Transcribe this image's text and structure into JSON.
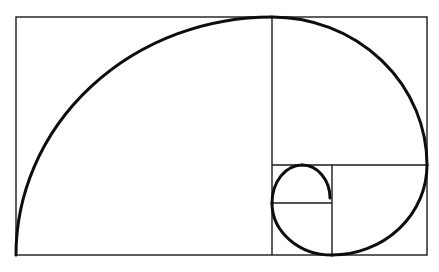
{
  "diagram": {
    "type": "golden-rectangle-spiral",
    "colors": {
      "background": "#ffffff",
      "line": "#1a1a1a",
      "spiral": "#0d0d0d"
    },
    "outer_rectangle": {
      "x": 16,
      "y": 17,
      "width": 411,
      "height": 238
    },
    "divider_lines": [
      {
        "name": "vertical-main",
        "x1": 272,
        "y1": 17,
        "x2": 272,
        "y2": 255
      },
      {
        "name": "horizontal-right",
        "x1": 272,
        "y1": 165,
        "x2": 427,
        "y2": 165
      },
      {
        "name": "vertical-small",
        "x1": 332,
        "y1": 165,
        "x2": 332,
        "y2": 255
      },
      {
        "name": "horizontal-small",
        "x1": 272,
        "y1": 203,
        "x2": 332,
        "y2": 203
      }
    ],
    "spiral_arcs": [
      {
        "name": "arc-1",
        "d": "M 16 255 A 256 238 0 0 1 272 17"
      },
      {
        "name": "arc-2",
        "d": "M 272 17 A 155 148 0 0 1 427 165"
      },
      {
        "name": "arc-3",
        "d": "M 427 165 A 95 90 0 0 1 332 255"
      },
      {
        "name": "arc-4",
        "d": "M 332 255 A 60 52 0 0 1 272 203"
      },
      {
        "name": "arc-5",
        "d": "M 272 203 A 30 38 0 0 1 302 165"
      },
      {
        "name": "arc-6",
        "d": "M 302 165 A 28 33 0 0 1 330 198"
      }
    ]
  }
}
